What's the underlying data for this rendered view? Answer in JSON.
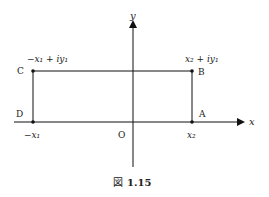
{
  "diagram": {
    "axes": {
      "x_label": "x",
      "y_label": "y",
      "origin_label": "O"
    },
    "points": {
      "A": {
        "label": "A"
      },
      "B": {
        "label": "B",
        "expr": "x₂ + iy₁"
      },
      "C": {
        "label": "C",
        "expr": "−x₁ + iy₁"
      },
      "D": {
        "label": "D"
      }
    },
    "x_ticks": {
      "left": "−x₁",
      "right": "x₂"
    },
    "caption": {
      "prefix": "図",
      "number": "1.15"
    }
  }
}
